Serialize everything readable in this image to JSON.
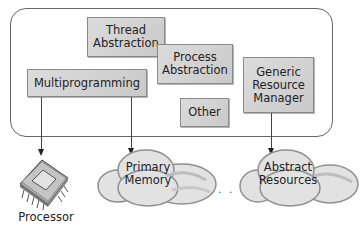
{
  "diagram": {
    "type": "architecture",
    "container": {
      "name": "operating-system"
    },
    "boxes": {
      "thread_abstraction": {
        "line1": "Thread",
        "line2": "Abstraction"
      },
      "process_abstraction": {
        "line1": "Process",
        "line2": "Abstraction"
      },
      "multiprogramming": {
        "label": "Multiprogramming"
      },
      "other": {
        "label": "Other"
      },
      "generic_resource_manager": {
        "line1": "Generic",
        "line2": "Resource",
        "line3": "Manager"
      }
    },
    "resources": {
      "processor": {
        "label": "Processor"
      },
      "primary_memory": {
        "line1": "Primary",
        "line2": "Memory"
      },
      "ellipsis": ". . . .",
      "abstract_resources": {
        "line1": "Abstract",
        "line2": "Resources"
      }
    },
    "edges": [
      {
        "from": "Multiprogramming",
        "to": "Processor"
      },
      {
        "from": "Multiprogramming",
        "to": "Primary Memory"
      },
      {
        "from": "Generic Resource Manager",
        "to": "Abstract Resources"
      }
    ],
    "colors": {
      "box_fill": "#d3d3d3",
      "box_border": "#8a8a8a",
      "container_border": "#666666",
      "cloud_fill": "#e2e2e2",
      "cloud_stroke": "#8f8f8f"
    }
  }
}
